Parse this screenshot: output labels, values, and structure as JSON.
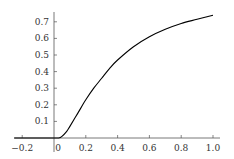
{
  "chart_data": {
    "type": "line",
    "title": "",
    "xlabel": "",
    "ylabel": "",
    "xlim": [
      -0.25,
      1.05
    ],
    "ylim": [
      0,
      0.78
    ],
    "grid": false,
    "legend": null,
    "x_ticks": [
      "−0.2",
      "0",
      "0.2",
      "0.4",
      "0.6",
      "0.8",
      "1.0"
    ],
    "x_tick_values": [
      -0.2,
      0,
      0.2,
      0.4,
      0.6,
      0.8,
      1.0
    ],
    "y_ticks": [
      "0.1",
      "0.2",
      "0.3",
      "0.4",
      "0.5",
      "0.6",
      "0.7"
    ],
    "y_tick_values": [
      0.1,
      0.2,
      0.3,
      0.4,
      0.5,
      0.6,
      0.7
    ],
    "series": [
      {
        "name": "f(x)",
        "color": "#000000",
        "x": [
          -0.25,
          0.0,
          0.03,
          0.05,
          0.08,
          0.1,
          0.15,
          0.2,
          0.25,
          0.3,
          0.35,
          0.4,
          0.5,
          0.6,
          0.7,
          0.8,
          0.9,
          1.0
        ],
        "y": [
          0.0,
          0.0,
          0.0,
          0.01,
          0.04,
          0.07,
          0.15,
          0.23,
          0.3,
          0.36,
          0.42,
          0.47,
          0.55,
          0.61,
          0.655,
          0.69,
          0.715,
          0.74
        ]
      }
    ]
  }
}
